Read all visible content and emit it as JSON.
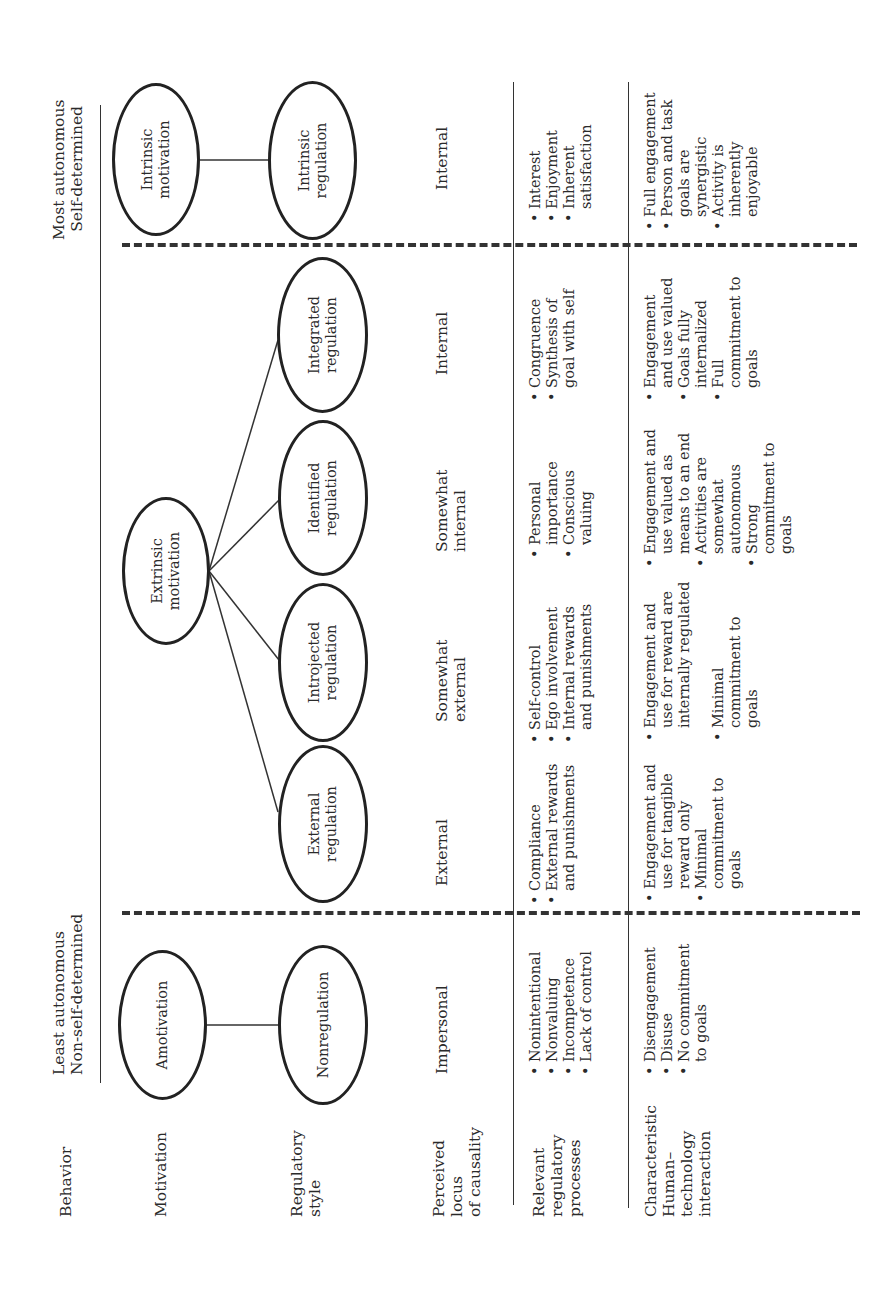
{
  "header": {
    "left_title_line1": "Least autonomous",
    "left_title_line2": "Non-self-determined",
    "right_title_line1": "Most autonomous",
    "right_title_line2": "Self-determined"
  },
  "row_labels": {
    "behavior": "Behavior",
    "motivation": "Motivation",
    "regulatory_style": "Regulatory\nstyle",
    "perceived_locus": "Perceived\nlocus\nof causality",
    "relevant_processes": "Relevant\nregulatory\nprocesses",
    "characteristic_interaction": "Characteristic\nHuman–\ntechnology\ninteraction"
  },
  "motivation": {
    "amotivation": "Amotivation",
    "extrinsic": "Extrinsic\nmotivation",
    "intrinsic": "Intrinsic\nmotivation"
  },
  "regulatory_styles": {
    "nonregulation": "Nonregulation",
    "external": "External\nregulation",
    "introjected": "Introjected\nregulation",
    "identified": "Identified\nregulation",
    "integrated": "Integrated\nregulation",
    "intrinsic": "Intrinsic\nregulation"
  },
  "locus": {
    "nonregulation": "Impersonal",
    "external": "External",
    "introjected": "Somewhat\nexternal",
    "identified": "Somewhat\ninternal",
    "integrated": "Internal",
    "intrinsic": "Internal"
  },
  "processes": {
    "nonregulation": [
      "Nonintentional",
      "Nonvaluing",
      "Incompetence",
      "Lack of control"
    ],
    "external": [
      "Compliance",
      "External rewards\nand punishments"
    ],
    "introjected": [
      "Self-control",
      "Ego involvement",
      "Internal rewards\nand punishments"
    ],
    "identified": [
      "Personal\nimportance",
      "Conscious\nvaluing"
    ],
    "integrated": [
      "Congruence",
      "Synthesis of\ngoal with self"
    ],
    "intrinsic": [
      "Interest",
      "Enjoyment",
      "Inherent\nsatisfaction"
    ]
  },
  "interaction": {
    "nonregulation": [
      "Disengagement",
      "Disuse",
      "No commitment\nto goals"
    ],
    "external": [
      "Engagement and\nuse for tangible\nreward only",
      "Minimal\ncommitment to\ngoals"
    ],
    "introjected": [
      "Engagement and\nuse for reward are\ninternally regulated",
      "Minimal\ncommitment to\ngoals"
    ],
    "identified": [
      "Engagement and\nuse valued as\nmeans to an end",
      "Activities are\nsomewhat\nautonomous",
      "Strong\ncommitment to\ngoals"
    ],
    "integrated": [
      "Engagement\nand use valued",
      "Goals fully\ninternalized",
      "Full\ncommitment to\ngoals"
    ],
    "intrinsic": [
      "Full engagement",
      "Person and task\ngoals are\nsynergistic",
      "Activity is\ninherently\nenjoyable"
    ]
  },
  "colors": {
    "ink": "#222222",
    "background": "#ffffff"
  }
}
